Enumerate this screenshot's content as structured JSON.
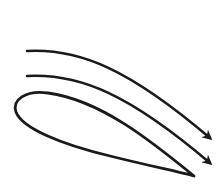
{
  "diagram": {
    "title": "",
    "colors": {
      "background": "#ffffff",
      "stroke": "#1a1a1a"
    },
    "elements": [
      {
        "id": "airflow-arrow-top",
        "type": "arrow",
        "label": ""
      },
      {
        "id": "airflow-arrow-middle",
        "type": "arrow",
        "label": ""
      },
      {
        "id": "airfoil",
        "type": "shape",
        "label": ""
      }
    ]
  }
}
